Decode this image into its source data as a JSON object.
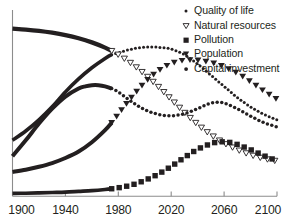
{
  "chart_data": {
    "type": "line",
    "title": "",
    "subtitle": "",
    "xlabel": "",
    "ylabel": "",
    "xlim": [
      1900,
      2100
    ],
    "ylim": [
      0,
      1
    ],
    "grid": false,
    "legend_position": "top-right",
    "xticks": [
      "1900",
      "1940",
      "1980",
      "2020",
      "2060",
      "2100"
    ],
    "xtick_values": [
      1900,
      1940,
      1980,
      2020,
      2060,
      2100
    ],
    "yticks": [],
    "projection_start_year": 1975,
    "series": [
      {
        "name": "Quality of life",
        "marker": "small-dot",
        "marker_filled": true,
        "x": [
          1900,
          1910,
          1920,
          1930,
          1940,
          1950,
          1960,
          1970,
          1975,
          1980,
          1990,
          2000,
          2010,
          2020,
          2030,
          2040,
          2050,
          2055,
          2060,
          2070,
          2080,
          2090,
          2100
        ],
        "y": [
          0.3,
          0.35,
          0.41,
          0.48,
          0.56,
          0.63,
          0.69,
          0.74,
          0.76,
          0.77,
          0.79,
          0.8,
          0.8,
          0.79,
          0.76,
          0.71,
          0.65,
          0.62,
          0.59,
          0.53,
          0.48,
          0.44,
          0.41
        ]
      },
      {
        "name": "Natural resources",
        "marker": "open-down-triangle",
        "marker_filled": false,
        "x": [
          1900,
          1910,
          1920,
          1930,
          1940,
          1950,
          1960,
          1970,
          1975,
          1980,
          1990,
          2000,
          2010,
          2020,
          2030,
          2040,
          2050,
          2060,
          2070,
          2080,
          2090,
          2100
        ],
        "y": [
          0.9,
          0.895,
          0.888,
          0.878,
          0.865,
          0.848,
          0.826,
          0.798,
          0.78,
          0.76,
          0.712,
          0.655,
          0.59,
          0.52,
          0.45,
          0.385,
          0.33,
          0.285,
          0.25,
          0.222,
          0.202,
          0.188
        ]
      },
      {
        "name": "Pollution",
        "marker": "filled-square",
        "marker_filled": true,
        "x": [
          1900,
          1910,
          1920,
          1930,
          1940,
          1950,
          1960,
          1970,
          1975,
          1980,
          1990,
          2000,
          2010,
          2020,
          2030,
          2040,
          2050,
          2055,
          2060,
          2065,
          2070,
          2080,
          2090,
          2100
        ],
        "y": [
          0.015,
          0.016,
          0.018,
          0.02,
          0.022,
          0.026,
          0.03,
          0.036,
          0.04,
          0.045,
          0.06,
          0.085,
          0.118,
          0.16,
          0.208,
          0.252,
          0.282,
          0.29,
          0.292,
          0.288,
          0.278,
          0.25,
          0.218,
          0.19
        ]
      },
      {
        "name": "Population",
        "marker": "filled-down-triangle",
        "marker_filled": true,
        "x": [
          1900,
          1910,
          1920,
          1930,
          1940,
          1950,
          1960,
          1970,
          1975,
          1980,
          1990,
          2000,
          2010,
          2020,
          2030,
          2040,
          2050,
          2055,
          2060,
          2070,
          2080,
          2090,
          2100
        ],
        "y": [
          0.13,
          0.142,
          0.158,
          0.178,
          0.205,
          0.24,
          0.29,
          0.355,
          0.395,
          0.44,
          0.53,
          0.61,
          0.672,
          0.712,
          0.73,
          0.73,
          0.718,
          0.708,
          0.695,
          0.66,
          0.615,
          0.565,
          0.52
        ]
      },
      {
        "name": "Capital investment",
        "marker": "filled-dot",
        "marker_filled": true,
        "x": [
          1900,
          1910,
          1920,
          1930,
          1940,
          1950,
          1955,
          1960,
          1965,
          1970,
          1975,
          1980,
          1990,
          2000,
          2010,
          2020,
          2030,
          2040,
          2045,
          2050,
          2055,
          2060,
          2070,
          2080,
          2090,
          2100
        ],
        "y": [
          0.215,
          0.3,
          0.39,
          0.47,
          0.535,
          0.578,
          0.59,
          0.596,
          0.596,
          0.59,
          0.578,
          0.56,
          0.508,
          0.465,
          0.44,
          0.432,
          0.443,
          0.47,
          0.486,
          0.5,
          0.505,
          0.5,
          0.47,
          0.43,
          0.395,
          0.372
        ]
      }
    ]
  },
  "legend": {
    "items": [
      {
        "label": "Quality of life",
        "marker": "small-dot-icon"
      },
      {
        "label": "Natural resources",
        "marker": "open-down-triangle-icon"
      },
      {
        "label": "Pollution",
        "marker": "filled-square-icon"
      },
      {
        "label": "Population",
        "marker": "filled-down-triangle-icon"
      },
      {
        "label": "Capital investment",
        "marker": "filled-dot-icon"
      }
    ]
  },
  "colors": {
    "ink": "#231f20",
    "axis": "#8c8c8c",
    "background": "#ffffff"
  }
}
